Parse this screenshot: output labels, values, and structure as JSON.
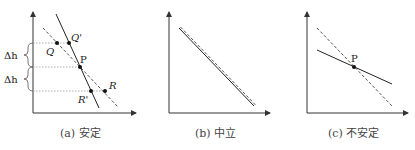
{
  "panels": [
    {
      "id": "a",
      "caption": "(a) 安定",
      "labels": {
        "Q": "Q",
        "Qp": "Q'",
        "P": "P",
        "R": "R",
        "Rp": "R'",
        "dh1": "Δh",
        "dh2": "Δh"
      }
    },
    {
      "id": "b",
      "caption": "(b) 中立"
    },
    {
      "id": "c",
      "caption": "(c) 不安定",
      "labels": {
        "P": "P"
      }
    }
  ],
  "colors": {
    "line": "#222222",
    "dashed": "#555555",
    "dotted": "#888888",
    "axis": "#333333"
  }
}
